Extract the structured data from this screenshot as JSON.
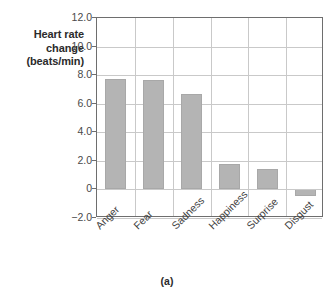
{
  "chart_data": {
    "type": "bar",
    "title": "",
    "subtitle": "",
    "categories": [
      "Anger",
      "Fear",
      "Sadness",
      "Happiness",
      "Surprise",
      "Disgust"
    ],
    "values": [
      7.7,
      7.65,
      6.65,
      1.8,
      1.4,
      -0.45
    ],
    "series": [
      {
        "name": "Heart rate change",
        "values": [
          7.7,
          7.65,
          6.65,
          1.8,
          1.4,
          -0.45
        ]
      }
    ],
    "xlabel": "",
    "ylabel": "Heart rate change (beats/min)",
    "ylabel_lines": [
      "Heart rate",
      "change",
      "(beats/min)"
    ],
    "ylim": [
      -2.0,
      12.0
    ],
    "yticks": [
      12.0,
      10.0,
      8.0,
      6.0,
      4.0,
      2.0,
      0,
      -2.0
    ],
    "ytick_labels": [
      "12.0",
      "10.0",
      "8.0",
      "6.0",
      "4.0",
      "2.0",
      "0",
      "−2.0"
    ],
    "grid": "horizontal-and-vertical",
    "legend": "none",
    "bar_color": "#b4b4b4",
    "grid_color": "#c9c9c9",
    "axis_color": "#6e6e6e",
    "label_rotation": -45,
    "caption": "(a)"
  }
}
